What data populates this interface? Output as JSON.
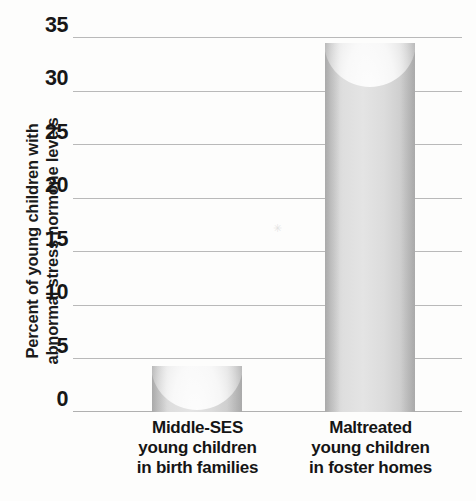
{
  "chart_data": {
    "type": "bar",
    "title": "",
    "subtitle": "",
    "xlabel": "",
    "ylabel_lines": [
      "Percent of young children with",
      "abnormal stress hormone levels"
    ],
    "ylabel": "Percent of young children with abnormal stress hormone levels",
    "categories": [
      "Middle-SES young children in birth families",
      "Maltreated young children in foster homes"
    ],
    "category_lines": [
      [
        "Middle-SES",
        "young children",
        "in birth families"
      ],
      [
        "Maltreated",
        "young children",
        "in foster homes"
      ]
    ],
    "values": [
      4.3,
      34.5
    ],
    "ylim": [
      0,
      35
    ],
    "yticks": [
      0,
      5,
      10,
      15,
      20,
      25,
      30,
      35
    ],
    "ytick_labels": [
      "0",
      "5",
      "10",
      "15",
      "20",
      "25",
      "30",
      "35"
    ],
    "grid": true,
    "legend": null,
    "bar_style": "cylinder",
    "colors": {
      "bar_fill": "#dedede",
      "bar_edge_shade": "#bfbfbf",
      "gridline": "#b9b9b9",
      "background": "#fdfdfc",
      "text": "#171717"
    }
  }
}
